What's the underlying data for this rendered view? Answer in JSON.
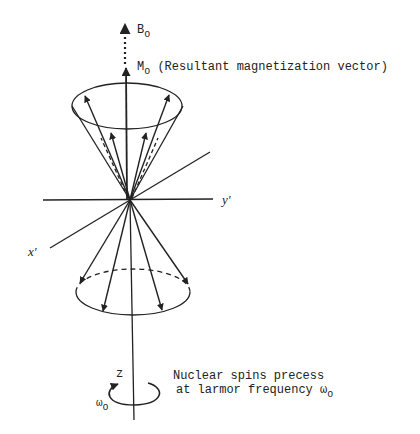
{
  "figure": {
    "labels": {
      "b0_main": "B",
      "b0_sub": "o",
      "m0_main": "M",
      "m0_sub": "o",
      "m0_desc": "(Resultant magnetization vector)",
      "y_axis": "y'",
      "x_axis": "x'",
      "z_axis": "z",
      "omega_main": "ω",
      "omega_sub": "o",
      "caption_line1": "Nuclear spins precess",
      "caption_line2_prefix": "at larmor frequency ",
      "caption_omega": "ω",
      "caption_omega_sub": "o"
    },
    "colors": {
      "ink": "#222222",
      "background": "#ffffff"
    },
    "elements": {
      "upper_cone": "precession cone above origin with 4 spin vectors",
      "lower_cone": "precession cone below origin with 4 spin vectors",
      "b0_arrow": "dotted arrow representing static field B0",
      "m0_arrow": "solid arrow representing net magnetization M0",
      "rotation_arrow": "circular arrow about z axis indicating precession"
    }
  }
}
